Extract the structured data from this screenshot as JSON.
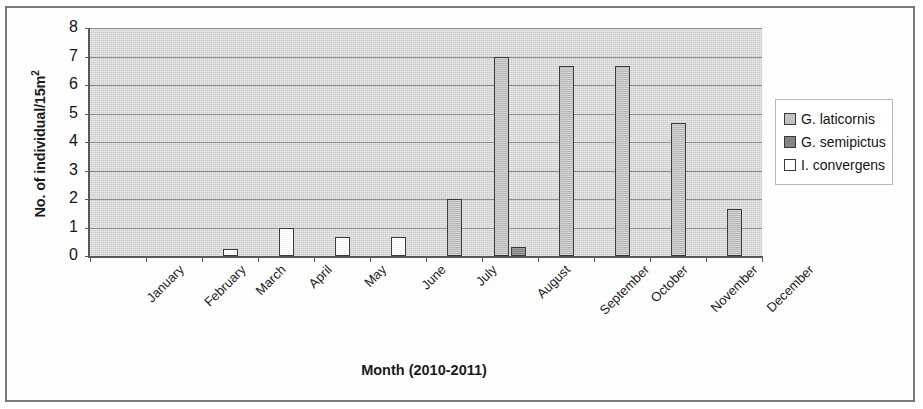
{
  "chart_data": {
    "type": "bar",
    "title": "",
    "xlabel": "Month (2010-2011)",
    "ylabel": "No. of individual/15m2",
    "ylabel_html": "No. of individual/15m<sup>2</sup>",
    "ylim": [
      0,
      8
    ],
    "ytick_labels": [
      "8",
      "7",
      "6",
      "5",
      "4",
      "3",
      "2",
      "1",
      "0"
    ],
    "ytick_values": [
      8,
      7,
      6,
      5,
      4,
      3,
      2,
      1,
      0
    ],
    "grid": true,
    "grid_axis": "y",
    "legend_position": "right",
    "categories": [
      "January",
      "February",
      "March",
      "April",
      "May",
      "June",
      "July",
      "August",
      "September",
      "October",
      "November",
      "December"
    ],
    "series": [
      {
        "name": "G. laticornis",
        "color": "#c2c2c2",
        "values": [
          0,
          0,
          0,
          0,
          0,
          0,
          2.0,
          7.0,
          6.65,
          6.65,
          4.65,
          1.65
        ]
      },
      {
        "name": "G. semipictus",
        "color": "#848484",
        "values": [
          0,
          0,
          0,
          0,
          0,
          0,
          0,
          0.3,
          0,
          0,
          0,
          0
        ]
      },
      {
        "name": "I. convergens",
        "color": "#ffffff",
        "values": [
          0,
          0,
          0.25,
          1.0,
          0.65,
          0.65,
          0,
          0,
          0,
          0,
          0,
          0
        ]
      }
    ]
  },
  "legend": {
    "items": [
      {
        "label": "G. laticornis",
        "color": "#c2c2c2"
      },
      {
        "label": "G. semipictus",
        "color": "#848484"
      },
      {
        "label": "I. convergens",
        "color": "#ffffff"
      }
    ]
  },
  "colors": {
    "plot_background": "#d9d9d9",
    "axis": "#585858",
    "gridline": "#8d8d8d",
    "bar_outline": "#3a3a3a",
    "text": "#141414",
    "frame": "#7a7a7a"
  }
}
